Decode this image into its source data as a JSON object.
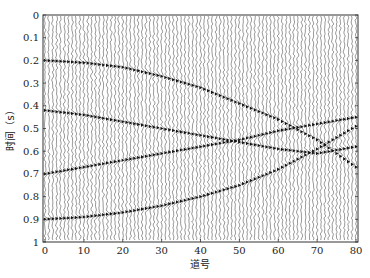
{
  "chart_data": {
    "type": "line",
    "subtype": "seismic-wiggle-section",
    "title": "",
    "xlabel": "道号",
    "ylabel": "时间（s）",
    "xlim": [
      0,
      81
    ],
    "ylim": [
      1,
      0
    ],
    "y_inverted": true,
    "x_ticks": [
      0,
      10,
      20,
      30,
      40,
      50,
      60,
      70,
      80
    ],
    "y_ticks": [
      0,
      0.1,
      0.2,
      0.3,
      0.4,
      0.5,
      0.6,
      0.7,
      0.8,
      0.9,
      1
    ],
    "y_tick_labels": [
      "0",
      "0.1",
      "0.2",
      "0.3",
      "0.4",
      "0.5",
      "0.6",
      "0.7",
      "0.8",
      "0.9",
      "1"
    ],
    "x_tick_labels": [
      "0",
      "10",
      "20",
      "30",
      "40",
      "50",
      "60",
      "70",
      "80"
    ],
    "grid": false,
    "legend": null,
    "trace_count": 81,
    "x": [
      0,
      10,
      20,
      30,
      40,
      50,
      60,
      70,
      80
    ],
    "series": [
      {
        "name": "event-1",
        "values": [
          0.2,
          0.21,
          0.23,
          0.27,
          0.32,
          0.39,
          0.46,
          0.55,
          0.67
        ]
      },
      {
        "name": "event-2",
        "values": [
          0.42,
          0.44,
          0.47,
          0.5,
          0.53,
          0.56,
          0.59,
          0.61,
          0.58
        ]
      },
      {
        "name": "event-3",
        "values": [
          0.7,
          0.67,
          0.64,
          0.61,
          0.58,
          0.55,
          0.51,
          0.48,
          0.45
        ]
      },
      {
        "name": "event-4",
        "values": [
          0.9,
          0.89,
          0.87,
          0.84,
          0.8,
          0.75,
          0.68,
          0.59,
          0.49
        ]
      }
    ]
  }
}
